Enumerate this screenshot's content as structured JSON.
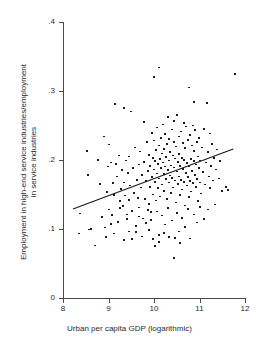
{
  "chart_data": {
    "type": "scatter",
    "title": "",
    "xlabel": "Urban per capita GDP (logarithmic)",
    "ylabel": "Employment in high-end service industries/employment in service industries",
    "ylabel_lines": [
      "Employment in high-end service industries/employment",
      "in service industries"
    ],
    "xlim": [
      8,
      12
    ],
    "ylim": [
      0,
      0.4
    ],
    "xticks": [
      8,
      9,
      10,
      11,
      12
    ],
    "xtick_labels": [
      "8",
      "9",
      "10",
      "11",
      "12"
    ],
    "yticks": [
      0,
      0.1,
      0.2,
      0.3,
      0.4
    ],
    "ytick_labels": [
      "0",
      ".1",
      ".2",
      ".3",
      ".4"
    ],
    "grid": false,
    "legend": "none",
    "marker_color": "#1a1a1a",
    "line_color": "#1a1a1a",
    "axis_color": "#4a4a4a",
    "fit_line": {
      "x": [
        8.22,
        11.74
      ],
      "y": [
        0.129,
        0.216
      ]
    },
    "points": [
      [
        8.35,
        0.093
      ],
      [
        8.37,
        0.122
      ],
      [
        8.52,
        0.213
      ],
      [
        8.54,
        0.178
      ],
      [
        8.57,
        0.099
      ],
      [
        8.62,
        0.1
      ],
      [
        8.7,
        0.076
      ],
      [
        8.78,
        0.2
      ],
      [
        8.82,
        0.165
      ],
      [
        8.86,
        0.117
      ],
      [
        8.9,
        0.234
      ],
      [
        8.93,
        0.102
      ],
      [
        8.96,
        0.153
      ],
      [
        8.98,
        0.19
      ],
      [
        9.0,
        0.128
      ],
      [
        9.02,
        0.222
      ],
      [
        9.05,
        0.196
      ],
      [
        9.08,
        0.12
      ],
      [
        9.1,
        0.166
      ],
      [
        9.13,
        0.149
      ],
      [
        9.15,
        0.281
      ],
      [
        9.17,
        0.194
      ],
      [
        9.19,
        0.176
      ],
      [
        9.21,
        0.11
      ],
      [
        9.23,
        0.206
      ],
      [
        9.25,
        0.14
      ],
      [
        9.27,
        0.158
      ],
      [
        9.29,
        0.185
      ],
      [
        9.31,
        0.133
      ],
      [
        9.33,
        0.275
      ],
      [
        9.35,
        0.167
      ],
      [
        9.37,
        0.148
      ],
      [
        9.39,
        0.199
      ],
      [
        9.41,
        0.121
      ],
      [
        9.43,
        0.181
      ],
      [
        9.45,
        0.205
      ],
      [
        9.46,
        0.142
      ],
      [
        9.48,
        0.163
      ],
      [
        9.5,
        0.27
      ],
      [
        9.52,
        0.126
      ],
      [
        9.54,
        0.188
      ],
      [
        9.56,
        0.152
      ],
      [
        9.58,
        0.218
      ],
      [
        9.6,
        0.104
      ],
      [
        9.62,
        0.171
      ],
      [
        9.64,
        0.145
      ],
      [
        9.66,
        0.193
      ],
      [
        9.68,
        0.131
      ],
      [
        9.7,
        0.212
      ],
      [
        9.72,
        0.16
      ],
      [
        9.74,
        0.178
      ],
      [
        9.76,
        0.115
      ],
      [
        9.78,
        0.197
      ],
      [
        9.79,
        0.255
      ],
      [
        9.8,
        0.143
      ],
      [
        9.82,
        0.169
      ],
      [
        9.84,
        0.226
      ],
      [
        9.86,
        0.184
      ],
      [
        9.88,
        0.136
      ],
      [
        9.9,
        0.207
      ],
      [
        9.91,
        0.161
      ],
      [
        9.92,
        0.191
      ],
      [
        9.94,
        0.124
      ],
      [
        9.95,
        0.239
      ],
      [
        9.96,
        0.175
      ],
      [
        9.97,
        0.203
      ],
      [
        9.98,
        0.15
      ],
      [
        9.99,
        0.186
      ],
      [
        10.0,
        0.32
      ],
      [
        10.01,
        0.228
      ],
      [
        10.02,
        0.168
      ],
      [
        10.03,
        0.198
      ],
      [
        10.04,
        0.141
      ],
      [
        10.05,
        0.214
      ],
      [
        10.06,
        0.18
      ],
      [
        10.07,
        0.247
      ],
      [
        10.08,
        0.159
      ],
      [
        10.09,
        0.194
      ],
      [
        10.1,
        0.334
      ],
      [
        10.11,
        0.221
      ],
      [
        10.12,
        0.173
      ],
      [
        10.13,
        0.201
      ],
      [
        10.14,
        0.147
      ],
      [
        10.15,
        0.232
      ],
      [
        10.16,
        0.188
      ],
      [
        10.17,
        0.209
      ],
      [
        10.18,
        0.164
      ],
      [
        10.19,
        0.196
      ],
      [
        10.2,
        0.251
      ],
      [
        10.21,
        0.179
      ],
      [
        10.22,
        0.216
      ],
      [
        10.23,
        0.155
      ],
      [
        10.24,
        0.19
      ],
      [
        10.25,
        0.237
      ],
      [
        10.26,
        0.172
      ],
      [
        10.27,
        0.204
      ],
      [
        10.28,
        0.143
      ],
      [
        10.29,
        0.223
      ],
      [
        10.3,
        0.185
      ],
      [
        10.31,
        0.262
      ],
      [
        10.32,
        0.167
      ],
      [
        10.33,
        0.199
      ],
      [
        10.34,
        0.23
      ],
      [
        10.35,
        0.177
      ],
      [
        10.36,
        0.211
      ],
      [
        10.37,
        0.152
      ],
      [
        10.38,
        0.192
      ],
      [
        10.39,
        0.244
      ],
      [
        10.4,
        0.174
      ],
      [
        10.41,
        0.206
      ],
      [
        10.42,
        0.16
      ],
      [
        10.43,
        0.226
      ],
      [
        10.44,
        0.189
      ],
      [
        10.45,
        0.256
      ],
      [
        10.46,
        0.17
      ],
      [
        10.47,
        0.202
      ],
      [
        10.48,
        0.138
      ],
      [
        10.49,
        0.219
      ],
      [
        10.5,
        0.183
      ],
      [
        10.51,
        0.265
      ],
      [
        10.52,
        0.165
      ],
      [
        10.53,
        0.197
      ],
      [
        10.54,
        0.234
      ],
      [
        10.55,
        0.176
      ],
      [
        10.56,
        0.208
      ],
      [
        10.57,
        0.149
      ],
      [
        10.58,
        0.191
      ],
      [
        10.59,
        0.241
      ],
      [
        10.6,
        0.171
      ],
      [
        10.61,
        0.203
      ],
      [
        10.62,
        0.157
      ],
      [
        10.63,
        0.224
      ],
      [
        10.64,
        0.187
      ],
      [
        10.65,
        0.253
      ],
      [
        10.66,
        0.168
      ],
      [
        10.67,
        0.2
      ],
      [
        10.68,
        0.134
      ],
      [
        10.69,
        0.217
      ],
      [
        10.7,
        0.181
      ],
      [
        10.71,
        0.248
      ],
      [
        10.72,
        0.163
      ],
      [
        10.73,
        0.195
      ],
      [
        10.74,
        0.229
      ],
      [
        10.75,
        0.175
      ],
      [
        10.76,
        0.305
      ],
      [
        10.77,
        0.146
      ],
      [
        10.78,
        0.19
      ],
      [
        10.79,
        0.236
      ],
      [
        10.8,
        0.169
      ],
      [
        10.81,
        0.201
      ],
      [
        10.82,
        0.154
      ],
      [
        10.83,
        0.221
      ],
      [
        10.84,
        0.184
      ],
      [
        10.85,
        0.25
      ],
      [
        10.86,
        0.166
      ],
      [
        10.87,
        0.198
      ],
      [
        10.88,
        0.284
      ],
      [
        10.89,
        0.213
      ],
      [
        10.9,
        0.178
      ],
      [
        10.91,
        0.243
      ],
      [
        10.92,
        0.161
      ],
      [
        10.93,
        0.193
      ],
      [
        10.94,
        0.226
      ],
      [
        10.95,
        0.172
      ],
      [
        10.96,
        0.205
      ],
      [
        10.97,
        0.14
      ],
      [
        10.98,
        0.188
      ],
      [
        10.99,
        0.232
      ],
      [
        11.0,
        0.167
      ],
      [
        11.02,
        0.199
      ],
      [
        11.04,
        0.151
      ],
      [
        11.06,
        0.218
      ],
      [
        11.08,
        0.182
      ],
      [
        11.1,
        0.245
      ],
      [
        11.12,
        0.164
      ],
      [
        11.14,
        0.196
      ],
      [
        11.16,
        0.282
      ],
      [
        11.18,
        0.211
      ],
      [
        11.2,
        0.176
      ],
      [
        11.22,
        0.238
      ],
      [
        11.24,
        0.159
      ],
      [
        11.26,
        0.191
      ],
      [
        11.28,
        0.223
      ],
      [
        11.3,
        0.17
      ],
      [
        11.32,
        0.203
      ],
      [
        11.34,
        0.135
      ],
      [
        11.36,
        0.186
      ],
      [
        11.38,
        0.215
      ],
      [
        11.42,
        0.173
      ],
      [
        11.46,
        0.198
      ],
      [
        11.5,
        0.155
      ],
      [
        11.58,
        0.161
      ],
      [
        11.62,
        0.156
      ],
      [
        11.78,
        0.324
      ],
      [
        9.52,
        0.085
      ],
      [
        9.6,
        0.095
      ],
      [
        9.68,
        0.118
      ],
      [
        9.74,
        0.089
      ],
      [
        9.82,
        0.108
      ],
      [
        9.86,
        0.127
      ],
      [
        9.9,
        0.098
      ],
      [
        9.94,
        0.113
      ],
      [
        10.02,
        0.075
      ],
      [
        10.06,
        0.125
      ],
      [
        10.12,
        0.091
      ],
      [
        10.18,
        0.119
      ],
      [
        10.24,
        0.106
      ],
      [
        10.3,
        0.13
      ],
      [
        10.34,
        0.088
      ],
      [
        10.4,
        0.112
      ],
      [
        10.44,
        0.058
      ],
      [
        10.5,
        0.123
      ],
      [
        10.56,
        0.096
      ],
      [
        10.62,
        0.116
      ],
      [
        10.68,
        0.103
      ],
      [
        10.74,
        0.129
      ],
      [
        10.8,
        0.086
      ],
      [
        10.88,
        0.121
      ],
      [
        10.94,
        0.109
      ],
      [
        11.02,
        0.132
      ],
      [
        11.1,
        0.114
      ],
      [
        11.18,
        0.128
      ],
      [
        9.34,
        0.084
      ],
      [
        9.4,
        0.114
      ],
      [
        9.46,
        0.096
      ],
      [
        9.26,
        0.13
      ],
      [
        9.12,
        0.093
      ],
      [
        9.06,
        0.107
      ],
      [
        8.94,
        0.088
      ],
      [
        10.1,
        0.081
      ],
      [
        10.22,
        0.094
      ],
      [
        10.46,
        0.087
      ],
      [
        10.58,
        0.079
      ],
      [
        9.98,
        0.085
      ]
    ]
  }
}
